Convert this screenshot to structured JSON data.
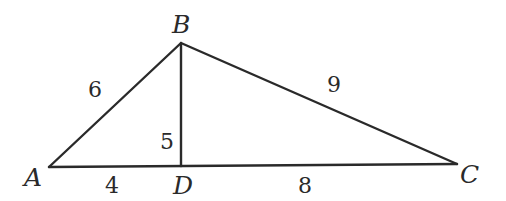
{
  "diagram": {
    "type": "geometry-triangle",
    "vertices": {
      "A": {
        "label": "A",
        "x": 49,
        "y": 167
      },
      "B": {
        "label": "B",
        "x": 181,
        "y": 43
      },
      "C": {
        "label": "C",
        "x": 457,
        "y": 164
      },
      "D": {
        "label": "D",
        "x": 181,
        "y": 166
      }
    },
    "segments": [
      {
        "name": "AB",
        "length_label": "6"
      },
      {
        "name": "BC",
        "length_label": "9"
      },
      {
        "name": "BD",
        "length_label": "5"
      },
      {
        "name": "AD",
        "length_label": "4"
      },
      {
        "name": "DC",
        "length_label": "8"
      }
    ],
    "line_color": "#2a2a2a",
    "background": "#ffffff"
  }
}
